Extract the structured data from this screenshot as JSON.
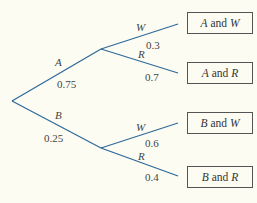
{
  "colors": {
    "branch": "#2f6a9a",
    "text": "#444444",
    "box_border": "#555555",
    "background": "#fdfcf3"
  },
  "first_stage": [
    {
      "event": "A",
      "prob": "0.75"
    },
    {
      "event": "B",
      "prob": "0.25"
    }
  ],
  "second_stage": {
    "A": [
      {
        "event": "W",
        "prob": "0.3"
      },
      {
        "event": "R",
        "prob": "0.7"
      }
    ],
    "B": [
      {
        "event": "W",
        "prob": "0.6"
      },
      {
        "event": "R",
        "prob": "0.4"
      }
    ]
  },
  "outcomes": [
    {
      "first": "A",
      "conj": "and",
      "second": "W"
    },
    {
      "first": "A",
      "conj": "and",
      "second": "R"
    },
    {
      "first": "B",
      "conj": "and",
      "second": "W"
    },
    {
      "first": "B",
      "conj": "and",
      "second": "R"
    }
  ]
}
